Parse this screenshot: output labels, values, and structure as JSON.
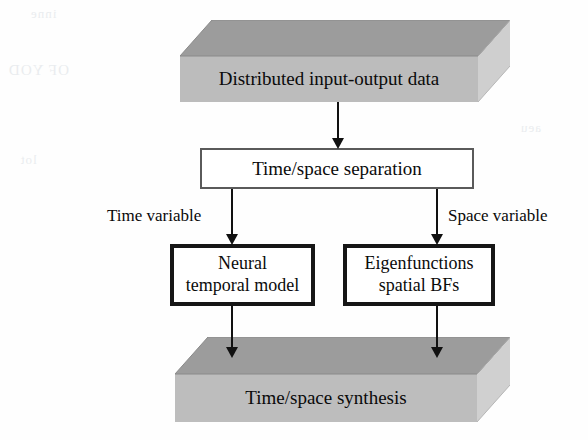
{
  "diagram": {
    "colors": {
      "slab_top": "#9c9c9c",
      "slab_front": "#bcbcbc",
      "slab_side": "#cdcdcd",
      "arrow": "#111111",
      "thin_border": "#5a5a5a",
      "thick_border": "#161616",
      "background": "#fefefe"
    },
    "nodes": {
      "input_slab": {
        "label": "Distributed input-output data",
        "shape": "3d-slab"
      },
      "separation_box": {
        "label": "Time/space separation",
        "shape": "rectangle"
      },
      "temporal_box": {
        "line1": "Neural",
        "line2": "temporal model",
        "shape": "rectangle"
      },
      "spatial_box": {
        "line1": "Eigenfunctions",
        "line2": "spatial BFs",
        "shape": "rectangle"
      },
      "synthesis_slab": {
        "label": "Time/space synthesis",
        "shape": "3d-slab"
      }
    },
    "edges": {
      "input_to_separation": {
        "label": ""
      },
      "separation_to_temporal": {
        "label": "Time variable"
      },
      "separation_to_spatial": {
        "label": "Space variable"
      },
      "temporal_to_synthesis": {
        "label": ""
      },
      "spatial_to_synthesis": {
        "label": ""
      }
    },
    "artifacts": {
      "a1": "OF YOD",
      "a2": "inne",
      "a3": "lot",
      "a4": "aeu"
    }
  }
}
